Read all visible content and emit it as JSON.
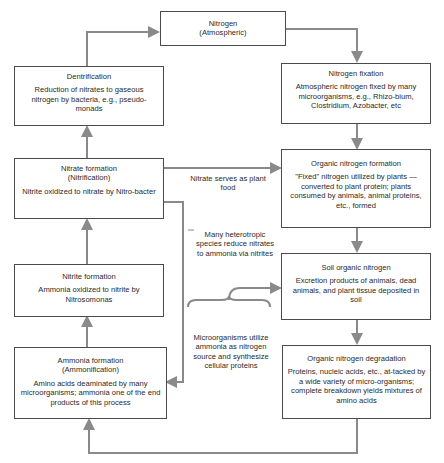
{
  "diagram": {
    "nodes": {
      "atmospheric": {
        "title": "Nitrogen",
        "subtitle": "(Atmospheric)"
      },
      "denitrification": {
        "title": "Dentrification",
        "body": "Reduction of nitrates to gaseous nitrogen by bacteria, e.g., pseudo-monads"
      },
      "fixation": {
        "title": "Nitrogen fixation",
        "body": "Atmospheric nitrogen fixed by many microorganisms, e.g., Rhizo-bium, Clostridium, Azobacter, etc"
      },
      "nitrate_formation": {
        "title": "Nitrate formation",
        "subtitle": "(Nitrification)",
        "body": "Nitrite oxidized to nitrate by Nitro-bacter"
      },
      "organic_formation": {
        "title": "Organic nitrogen formation",
        "body": "\"Fixed\" nitrogen utilized by plants —converted to plant protein; plants consumed by animals, animal proteins, etc., formed"
      },
      "nitrite_formation": {
        "title": "Nitrite formation",
        "body": "Ammonia oxidized to nitrite by Nitrosomonas"
      },
      "soil_organic": {
        "title": "Soil organic nitrogen",
        "body": "Excretion products of animals, dead animals, and plant tissue deposited in soil"
      },
      "ammonia_formation": {
        "title": "Ammonia formation",
        "subtitle": "(Ammonification)",
        "body": "Amino acids deaminated by many microorganisms; ammonia one of the end products of this process"
      },
      "degradation": {
        "title": "Organic nitrogen degradation",
        "body": "Proteins, nucleic acids, etc., at-tacked by a wide variety of micro-organisms; complete breakdown yields mixtures of amino acids"
      }
    },
    "edge_labels": {
      "plant_food": "Nitrate serves as plant food",
      "heterotropic": "Many heterotropic species reduce nitrates to ammonia via nitrites",
      "microorganisms": "Microorganisms utilize ammonia as nitrogen source and synthesize cellular proteins"
    },
    "colors": {
      "line": "#8a8a8a",
      "border": "#4a4a4a",
      "text": "#2a2a2a"
    }
  }
}
